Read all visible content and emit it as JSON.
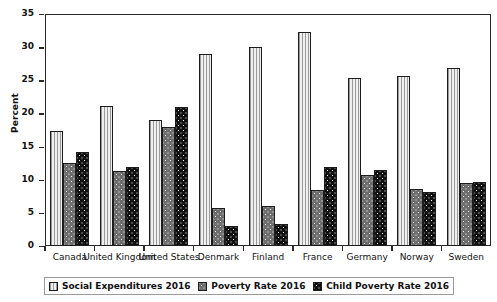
{
  "chart_data": {
    "type": "bar",
    "title": "",
    "xlabel": "",
    "ylabel": "Percent",
    "ylim": [
      0,
      35
    ],
    "yticks": [
      0,
      5,
      10,
      15,
      20,
      25,
      30,
      35
    ],
    "grid": false,
    "legend_position": "bottom",
    "categories": [
      "Canada",
      "United Kingdom",
      "United States",
      "Denmark",
      "Finland",
      "France",
      "Germany",
      "Norway",
      "Sweden"
    ],
    "series": [
      {
        "name": "Social Expenditures 2016",
        "pattern": "vertical-stripes",
        "color": "#d2d2d2",
        "values": [
          17.4,
          21.1,
          19.0,
          28.9,
          30.0,
          32.3,
          25.4,
          25.7,
          26.9
        ]
      },
      {
        "name": "Poverty Rate 2016",
        "pattern": "gray-dots",
        "color": "#6e6e6e",
        "values": [
          12.5,
          11.3,
          18.0,
          5.8,
          6.1,
          8.5,
          10.7,
          8.6,
          9.5
        ]
      },
      {
        "name": "Child Poverty Rate 2016",
        "pattern": "black-dots",
        "color": "#101010",
        "values": [
          14.2,
          11.9,
          20.9,
          3.0,
          3.3,
          11.9,
          11.5,
          8.1,
          9.7
        ]
      }
    ]
  },
  "legend": {
    "items": [
      {
        "label": "Social Expenditures 2016"
      },
      {
        "label": "Poverty Rate 2016"
      },
      {
        "label": "Child Poverty Rate 2016"
      }
    ]
  }
}
